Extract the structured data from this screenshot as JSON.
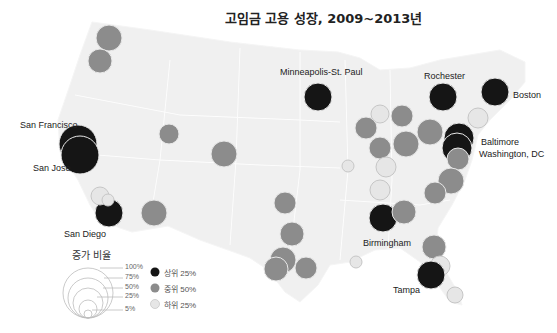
{
  "title": "고임금 고용 성장, 2009~2013년",
  "colors": {
    "top": "#151515",
    "middle": "#8c8c8c",
    "bottom": "#e6e6e6",
    "map_fill": "#f0f0f0",
    "map_border": "#ffffff"
  },
  "labels": {
    "san_francisco": "San Francisco",
    "san_jose": "San Jose",
    "san_diego": "San Diego",
    "minneapolis": "Minneapolis-St. Paul",
    "rochester": "Rochester",
    "boston": "Boston",
    "baltimore": "Baltimore",
    "washington": "Washington, DC",
    "birmingham": "Birmingham",
    "tampa": "Tampa"
  },
  "legend": {
    "title": "증가 비율",
    "sizes": [
      "100%",
      "75%",
      "50%",
      "25%",
      "5%"
    ],
    "categories": {
      "top": "상위 25%",
      "middle": "중위 50%",
      "bottom": "하위 25%"
    }
  },
  "chart_data": {
    "type": "scatter",
    "title": "고임금 고용 성장, 2009~2013년",
    "legend_size_title": "증가 비율",
    "size_scale": [
      "5%",
      "25%",
      "50%",
      "75%",
      "100%"
    ],
    "tiers": [
      "상위 25%",
      "중위 50%",
      "하위 25%"
    ],
    "points": [
      {
        "city": "Seattle (unlabeled)",
        "x": 109,
        "y": 38,
        "r": 13,
        "tier": "middle"
      },
      {
        "city": "Portland (unlabeled)",
        "x": 100,
        "y": 61,
        "r": 12,
        "tier": "middle"
      },
      {
        "city": "San Francisco",
        "x": 78,
        "y": 144,
        "r": 19,
        "tier": "top"
      },
      {
        "city": "San Jose",
        "x": 80,
        "y": 155,
        "r": 19,
        "tier": "top"
      },
      {
        "city": "San Diego",
        "x": 109,
        "y": 213,
        "r": 14,
        "tier": "top"
      },
      {
        "city": "Los Angeles (unlabeled)",
        "x": 100,
        "y": 196,
        "r": 9,
        "tier": "bottom"
      },
      {
        "city": "Riverside (unlabeled)",
        "x": 108,
        "y": 200,
        "r": 6,
        "tier": "bottom"
      },
      {
        "city": "Sacramento/Salt Lake area (unlabeled)",
        "x": 169,
        "y": 134,
        "r": 10,
        "tier": "middle"
      },
      {
        "city": "Denver (unlabeled)",
        "x": 224,
        "y": 154,
        "r": 13,
        "tier": "middle"
      },
      {
        "city": "Phoenix (unlabeled)",
        "x": 154,
        "y": 213,
        "r": 13,
        "tier": "middle"
      },
      {
        "city": "Oklahoma City (unlabeled)",
        "x": 285,
        "y": 203,
        "r": 11,
        "tier": "middle"
      },
      {
        "city": "Dallas (unlabeled)",
        "x": 292,
        "y": 234,
        "r": 12,
        "tier": "middle"
      },
      {
        "city": "Austin (unlabeled)",
        "x": 283,
        "y": 260,
        "r": 13,
        "tier": "middle"
      },
      {
        "city": "San Antonio (unlabeled)",
        "x": 276,
        "y": 269,
        "r": 12,
        "tier": "middle"
      },
      {
        "city": "Houston (unlabeled)",
        "x": 306,
        "y": 268,
        "r": 11,
        "tier": "middle"
      },
      {
        "city": "Minneapolis-St. Paul",
        "x": 318,
        "y": 97,
        "r": 14,
        "tier": "top"
      },
      {
        "city": "Milwaukee (unlabeled)",
        "x": 380,
        "y": 114,
        "r": 9,
        "tier": "bottom"
      },
      {
        "city": "Chicago area (unlabeled)",
        "x": 402,
        "y": 116,
        "r": 11,
        "tier": "middle"
      },
      {
        "city": "Des Moines area (unlabeled)",
        "x": 366,
        "y": 128,
        "r": 11,
        "tier": "middle"
      },
      {
        "city": "Detroit area (unlabeled)",
        "x": 430,
        "y": 132,
        "r": 13,
        "tier": "middle"
      },
      {
        "city": "Indianapolis (unlabeled)",
        "x": 380,
        "y": 148,
        "r": 11,
        "tier": "middle"
      },
      {
        "city": "Columbus (unlabeled)",
        "x": 406,
        "y": 144,
        "r": 13,
        "tier": "middle"
      },
      {
        "city": "Kansas City (unlabeled)",
        "x": 348,
        "y": 166,
        "r": 6,
        "tier": "bottom"
      },
      {
        "city": "Louisville (unlabeled)",
        "x": 386,
        "y": 167,
        "r": 10,
        "tier": "bottom"
      },
      {
        "city": "Nashville area (unlabeled)",
        "x": 380,
        "y": 190,
        "r": 10,
        "tier": "bottom"
      },
      {
        "city": "Rochester",
        "x": 443,
        "y": 97,
        "r": 14,
        "tier": "top"
      },
      {
        "city": "Boston",
        "x": 495,
        "y": 92,
        "r": 14,
        "tier": "top"
      },
      {
        "city": "Hartford (unlabeled)",
        "x": 478,
        "y": 118,
        "r": 10,
        "tier": "bottom"
      },
      {
        "city": "Baltimore",
        "x": 459,
        "y": 138,
        "r": 15,
        "tier": "top"
      },
      {
        "city": "Washington, DC",
        "x": 457,
        "y": 148,
        "r": 15,
        "tier": "top"
      },
      {
        "city": "Richmond (unlabeled)",
        "x": 458,
        "y": 159,
        "r": 11,
        "tier": "middle"
      },
      {
        "city": "Raleigh (unlabeled)",
        "x": 451,
        "y": 181,
        "r": 13,
        "tier": "middle"
      },
      {
        "city": "Charlotte (unlabeled)",
        "x": 435,
        "y": 193,
        "r": 11,
        "tier": "middle"
      },
      {
        "city": "Birmingham",
        "x": 383,
        "y": 218,
        "r": 14,
        "tier": "top"
      },
      {
        "city": "Atlanta (unlabeled)",
        "x": 404,
        "y": 212,
        "r": 12,
        "tier": "middle"
      },
      {
        "city": "Jacksonville (unlabeled)",
        "x": 434,
        "y": 247,
        "r": 12,
        "tier": "middle"
      },
      {
        "city": "Orlando (unlabeled)",
        "x": 440,
        "y": 266,
        "r": 10,
        "tier": "bottom"
      },
      {
        "city": "Tampa",
        "x": 431,
        "y": 275,
        "r": 14,
        "tier": "top"
      },
      {
        "city": "Miami (unlabeled)",
        "x": 455,
        "y": 295,
        "r": 8,
        "tier": "bottom"
      },
      {
        "city": "New Orleans (unlabeled)",
        "x": 356,
        "y": 262,
        "r": 6,
        "tier": "bottom"
      }
    ]
  }
}
